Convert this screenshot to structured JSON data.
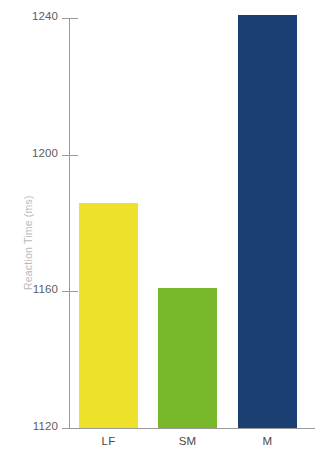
{
  "chart_data": {
    "type": "bar",
    "title": "",
    "subtitle": "",
    "xlabel": "",
    "ylabel": "Reaction Time (ms)",
    "categories": [
      "LF",
      "SM",
      "M"
    ],
    "values": [
      1186,
      1161,
      1241
    ],
    "series": [
      {
        "name": "Reaction Time",
        "values": [
          1186,
          1161,
          1241
        ],
        "colors": [
          "#ede12b",
          "#78b82a",
          "#1b3f72"
        ]
      }
    ],
    "ylim": [
      1120,
      1240
    ],
    "yticks": [
      1120,
      1160,
      1200,
      1240
    ],
    "ytick_labels": [
      "1120",
      "1160",
      "1200",
      "1240"
    ],
    "grid": false,
    "legend": false,
    "legend_position": "none",
    "bar_colors": {
      "LF": "#ede12b",
      "SM": "#78b82a",
      "M": "#1b3f72"
    }
  },
  "axis": {
    "y_title": "Reaction Time (ms)",
    "y_title_color": "#b9b9b9",
    "tick_color": "#9a9a9a",
    "tick_label_color": "#5d5d5d",
    "category_label_color": "#4a4a4a"
  },
  "ticks": [
    {
      "label": "1240",
      "value": 1240
    },
    {
      "label": "1200",
      "value": 1200
    },
    {
      "label": "1160",
      "value": 1160
    },
    {
      "label": "1120",
      "value": 1120
    }
  ],
  "bars": [
    {
      "label": "LF",
      "value": 1186,
      "color": "#ede12b"
    },
    {
      "label": "SM",
      "value": 1161,
      "color": "#78b82a"
    },
    {
      "label": "M",
      "value": 1241,
      "color": "#1b3f72"
    }
  ],
  "background": "#ffffff"
}
